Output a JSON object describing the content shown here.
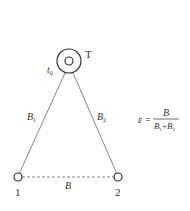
{
  "diagram": {
    "station": {
      "label": "T",
      "time_label": "t",
      "time_sub": "0"
    },
    "points": [
      {
        "id": "point-1",
        "label": "1"
      },
      {
        "id": "point-2",
        "label": "2"
      }
    ],
    "edges": {
      "left": {
        "label": "B",
        "sub": "1"
      },
      "right": {
        "label": "B",
        "sub": "2"
      },
      "base": {
        "label": "B"
      }
    },
    "formula": {
      "lhs": "ε",
      "eq": "=",
      "numerator": "B",
      "den_a": "B",
      "den_a_sub": "1",
      "den_plus": "+",
      "den_b": "B",
      "den_b_sub": "2"
    },
    "colors": {
      "line": "#555555",
      "text": "#333333"
    }
  }
}
